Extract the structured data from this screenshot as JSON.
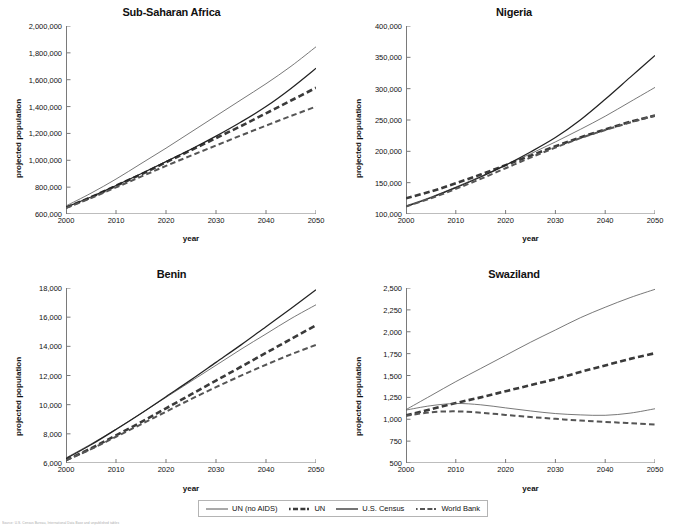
{
  "figure": {
    "xlabel": "year",
    "ylabel": "projected population",
    "footnote": "Source: U.S. Census Bureau, International Data Base and unpublished tables"
  },
  "legend": {
    "position": "bottom-center",
    "items": [
      {
        "label": "UN (no AIDS)",
        "style": "thin-solid",
        "color": "#555555"
      },
      {
        "label": "UN",
        "style": "thick-dashed",
        "color": "#3a3a3a"
      },
      {
        "label": "U.S. Census",
        "style": "thick-solid",
        "color": "#222222"
      },
      {
        "label": "World Bank",
        "style": "medium-dashed",
        "color": "#555555"
      }
    ]
  },
  "chart_data": [
    {
      "type": "line",
      "title": "Sub-Saharan Africa",
      "xlabel": "year",
      "ylabel": "projected population",
      "xlim": [
        2000,
        2050
      ],
      "ylim": [
        600000,
        2000000
      ],
      "xticks": [
        2000,
        2010,
        2020,
        2030,
        2040,
        2050
      ],
      "yticks": [
        600000,
        800000,
        1000000,
        1200000,
        1400000,
        1600000,
        1800000,
        2000000
      ],
      "ytick_labels": [
        "600,000",
        "800,000",
        "1,000,000",
        "1,200,000",
        "1,400,000",
        "1,600,000",
        "1,800,000",
        "2,000,000"
      ],
      "grid": false,
      "x": [
        2000,
        2005,
        2010,
        2015,
        2020,
        2025,
        2030,
        2035,
        2040,
        2045,
        2050
      ],
      "series": [
        {
          "name": "UN (no AIDS)",
          "style": "thin-solid",
          "values": [
            660000,
            755000,
            860000,
            975000,
            1090000,
            1210000,
            1330000,
            1450000,
            1570000,
            1700000,
            1845000
          ]
        },
        {
          "name": "UN",
          "style": "thick-dashed",
          "values": [
            648000,
            725000,
            810000,
            895000,
            985000,
            1075000,
            1165000,
            1255000,
            1350000,
            1445000,
            1540000
          ]
        },
        {
          "name": "U.S. Census",
          "style": "thick-solid",
          "values": [
            650000,
            727000,
            812000,
            900000,
            990000,
            1082000,
            1180000,
            1285000,
            1400000,
            1535000,
            1685000
          ]
        },
        {
          "name": "World Bank",
          "style": "medium-dashed",
          "values": [
            645000,
            718000,
            798000,
            878000,
            958000,
            1035000,
            1110000,
            1185000,
            1258000,
            1330000,
            1400000
          ]
        }
      ]
    },
    {
      "type": "line",
      "title": "Nigeria",
      "xlabel": "year",
      "ylabel": "projected population",
      "xlim": [
        2000,
        2050
      ],
      "ylim": [
        100000,
        400000
      ],
      "xticks": [
        2000,
        2010,
        2020,
        2030,
        2040,
        2050
      ],
      "yticks": [
        100000,
        150000,
        200000,
        250000,
        300000,
        350000,
        400000
      ],
      "ytick_labels": [
        "100,000",
        "150,000",
        "200,000",
        "250,000",
        "300,000",
        "350,000",
        "400,000"
      ],
      "grid": false,
      "x": [
        2000,
        2005,
        2010,
        2015,
        2020,
        2025,
        2030,
        2035,
        2040,
        2045,
        2050
      ],
      "series": [
        {
          "name": "UN (no AIDS)",
          "style": "thin-solid",
          "values": [
            113000,
            127000,
            143000,
            160000,
            178000,
            196000,
            215000,
            235000,
            256000,
            279000,
            302000
          ]
        },
        {
          "name": "UN",
          "style": "thick-dashed",
          "values": [
            125000,
            136000,
            149000,
            163000,
            178000,
            193000,
            208000,
            222000,
            235000,
            247000,
            257000
          ]
        },
        {
          "name": "U.S. Census",
          "style": "thick-solid",
          "values": [
            112000,
            126000,
            142000,
            159000,
            178000,
            199000,
            222000,
            250000,
            283000,
            318000,
            353000
          ]
        },
        {
          "name": "World Bank",
          "style": "medium-dashed",
          "values": [
            112000,
            125000,
            140000,
            156000,
            173000,
            190000,
            206000,
            221000,
            234000,
            246000,
            257000
          ]
        }
      ]
    },
    {
      "type": "line",
      "title": "Benin",
      "xlabel": "year",
      "ylabel": "projected population",
      "xlim": [
        2000,
        2050
      ],
      "ylim": [
        6000,
        18000
      ],
      "xticks": [
        2000,
        2010,
        2020,
        2030,
        2040,
        2050
      ],
      "yticks": [
        6000,
        8000,
        10000,
        12000,
        14000,
        16000,
        18000
      ],
      "ytick_labels": [
        "6,000",
        "8,000",
        "10,000",
        "12,000",
        "14,000",
        "16,000",
        "18,000"
      ],
      "grid": false,
      "x": [
        2000,
        2005,
        2010,
        2015,
        2020,
        2025,
        2030,
        2035,
        2040,
        2045,
        2050
      ],
      "series": [
        {
          "name": "UN (no AIDS)",
          "style": "thin-solid",
          "values": [
            6350,
            7300,
            8320,
            9400,
            10500,
            11600,
            12700,
            13800,
            14850,
            15900,
            16850
          ]
        },
        {
          "name": "UN",
          "style": "thick-dashed",
          "values": [
            6200,
            7000,
            7900,
            8800,
            9750,
            10700,
            11650,
            12600,
            13550,
            14500,
            15450
          ]
        },
        {
          "name": "U.S. Census",
          "style": "thick-solid",
          "values": [
            6300,
            7250,
            8300,
            9400,
            10550,
            11700,
            12900,
            14100,
            15350,
            16600,
            17880
          ]
        },
        {
          "name": "World Bank",
          "style": "medium-dashed",
          "values": [
            6180,
            6950,
            7800,
            8650,
            9520,
            10380,
            11200,
            11990,
            12740,
            13450,
            14100
          ]
        }
      ]
    },
    {
      "type": "line",
      "title": "Swaziland",
      "xlabel": "year",
      "ylabel": "projected population",
      "xlim": [
        2000,
        2050
      ],
      "ylim": [
        500,
        2500
      ],
      "xticks": [
        2000,
        2010,
        2020,
        2030,
        2040,
        2050
      ],
      "yticks": [
        500,
        750,
        1000,
        1250,
        1500,
        1750,
        2000,
        2250,
        2500
      ],
      "ytick_labels": [
        "500",
        "750",
        "1,000",
        "1,250",
        "1,500",
        "1,750",
        "2,000",
        "2,250",
        "2,500"
      ],
      "grid": false,
      "x": [
        2000,
        2005,
        2010,
        2015,
        2020,
        2025,
        2030,
        2035,
        2040,
        2045,
        2050
      ],
      "series": [
        {
          "name": "UN (no AIDS)",
          "style": "thin-solid",
          "values": [
            1110,
            1270,
            1430,
            1580,
            1730,
            1880,
            2020,
            2160,
            2280,
            2390,
            2485
          ]
        },
        {
          "name": "UN",
          "style": "thick-dashed",
          "values": [
            1045,
            1115,
            1185,
            1250,
            1320,
            1390,
            1460,
            1540,
            1615,
            1690,
            1755
          ]
        },
        {
          "name": "U.S. Census",
          "style": "thin-solid",
          "values": [
            1105,
            1155,
            1180,
            1165,
            1130,
            1095,
            1065,
            1050,
            1045,
            1070,
            1120
          ]
        },
        {
          "name": "World Bank",
          "style": "medium-dashed",
          "values": [
            1040,
            1080,
            1090,
            1075,
            1050,
            1025,
            1005,
            985,
            970,
            955,
            940
          ]
        }
      ]
    }
  ]
}
